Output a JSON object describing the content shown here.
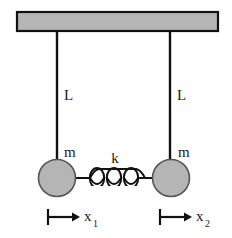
{
  "figure": {
    "background_color": "#ffffff"
  },
  "ceiling": {
    "label": "ceiling-support-bar",
    "fill_color": "#b5b5b5",
    "stroke_color": "#111111",
    "x": 17,
    "y": 12,
    "width": 201,
    "height": 19
  },
  "strings": [
    {
      "name": "left-pendulum-string",
      "label": "L",
      "x": 57,
      "y_top": 31,
      "y_bottom": 178,
      "label_x": 64,
      "label_y": 100
    },
    {
      "name": "right-pendulum-string",
      "label": "L",
      "x": 170,
      "y_top": 31,
      "y_bottom": 178,
      "label_x": 177,
      "label_y": 100
    }
  ],
  "bobs": [
    {
      "name": "left-pendulum-bob",
      "mass_label": "m",
      "cx": 57,
      "cy": 178,
      "r": 18.5,
      "fill_color": "#b5b5b5",
      "stroke_color": "#555555",
      "label_x": 64,
      "label_y": 157
    },
    {
      "name": "right-pendulum-bob",
      "mass_label": "m",
      "cx": 171,
      "cy": 178,
      "r": 18.5,
      "fill_color": "#b5b5b5",
      "stroke_color": "#555555",
      "label_x": 178,
      "label_y": 157
    }
  ],
  "spring": {
    "name": "coupling-spring",
    "label": "k",
    "label_x": 115,
    "label_y": 163,
    "x_start": 76,
    "x_end": 152,
    "y": 178,
    "coils": 3,
    "stroke_color": "#111111"
  },
  "displacements": [
    {
      "name": "displacement-x1",
      "label": "x",
      "subscript": "1",
      "tick_x": 48,
      "y": 217,
      "arrow_end_x": 80,
      "label_x": 84,
      "label_y": 221,
      "sub_x": 93,
      "sub_y": 227
    },
    {
      "name": "displacement-x2",
      "label": "x",
      "subscript": "2",
      "tick_x": 160,
      "y": 217,
      "arrow_end_x": 192,
      "label_x": 196,
      "label_y": 221,
      "sub_x": 205,
      "sub_y": 227
    }
  ],
  "colors": {
    "gray_fill": "#b5b5b5",
    "outline": "#111111",
    "bob_outline": "#555555",
    "text": "#1a1a1a"
  }
}
